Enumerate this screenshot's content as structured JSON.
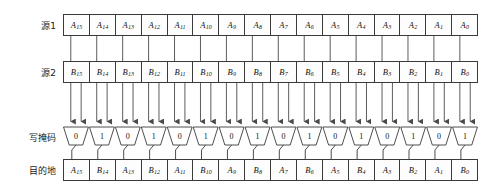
{
  "diagram": {
    "title_labels": {
      "source1": "源1",
      "source2": "源2",
      "write_mask": "写掩码",
      "destination": "目的地"
    },
    "source1": {
      "label": "源1",
      "cells": [
        {
          "base": "A",
          "sub": "15"
        },
        {
          "base": "A",
          "sub": "14"
        },
        {
          "base": "A",
          "sub": "13"
        },
        {
          "base": "A",
          "sub": "12"
        },
        {
          "base": "A",
          "sub": "11"
        },
        {
          "base": "A",
          "sub": "10"
        },
        {
          "base": "A",
          "sub": "9"
        },
        {
          "base": "A",
          "sub": "8"
        },
        {
          "base": "A",
          "sub": "7"
        },
        {
          "base": "A",
          "sub": "6"
        },
        {
          "base": "A",
          "sub": "5"
        },
        {
          "base": "A",
          "sub": "4"
        },
        {
          "base": "A",
          "sub": "3"
        },
        {
          "base": "A",
          "sub": "2"
        },
        {
          "base": "A",
          "sub": "1"
        },
        {
          "base": "A",
          "sub": "0"
        }
      ]
    },
    "source2": {
      "label": "源2",
      "cells": [
        {
          "base": "B",
          "sub": "15"
        },
        {
          "base": "B",
          "sub": "14"
        },
        {
          "base": "B",
          "sub": "13"
        },
        {
          "base": "B",
          "sub": "12"
        },
        {
          "base": "B",
          "sub": "11"
        },
        {
          "base": "B",
          "sub": "10"
        },
        {
          "base": "B",
          "sub": "9"
        },
        {
          "base": "B",
          "sub": "8"
        },
        {
          "base": "B",
          "sub": "7"
        },
        {
          "base": "B",
          "sub": "6"
        },
        {
          "base": "B",
          "sub": "5"
        },
        {
          "base": "B",
          "sub": "4"
        },
        {
          "base": "B",
          "sub": "3"
        },
        {
          "base": "B",
          "sub": "2"
        },
        {
          "base": "B",
          "sub": "1"
        },
        {
          "base": "B",
          "sub": "0"
        }
      ]
    },
    "write_mask": {
      "label": "写掩码",
      "bits": [
        "0",
        "1",
        "0",
        "1",
        "0",
        "1",
        "0",
        "1",
        "0",
        "1",
        "0",
        "1",
        "0",
        "1",
        "0",
        "1"
      ]
    },
    "destination": {
      "label": "目的地",
      "cells": [
        {
          "base": "A",
          "sub": "15"
        },
        {
          "base": "B",
          "sub": "14"
        },
        {
          "base": "A",
          "sub": "13"
        },
        {
          "base": "B",
          "sub": "12"
        },
        {
          "base": "A",
          "sub": "11"
        },
        {
          "base": "B",
          "sub": "10"
        },
        {
          "base": "A",
          "sub": "9"
        },
        {
          "base": "B",
          "sub": "8"
        },
        {
          "base": "A",
          "sub": "7"
        },
        {
          "base": "B",
          "sub": "6"
        },
        {
          "base": "A",
          "sub": "5"
        },
        {
          "base": "B",
          "sub": "4"
        },
        {
          "base": "A",
          "sub": "3"
        },
        {
          "base": "B",
          "sub": "2"
        },
        {
          "base": "A",
          "sub": "1"
        },
        {
          "base": "B",
          "sub": "0"
        }
      ]
    },
    "colors": {
      "stroke": "#3a3a3a",
      "wire": "#4a4a4a",
      "cell_fill": "#fdfdfd",
      "text": "#111111",
      "background": "#ffffff"
    },
    "lane_count": 16
  }
}
